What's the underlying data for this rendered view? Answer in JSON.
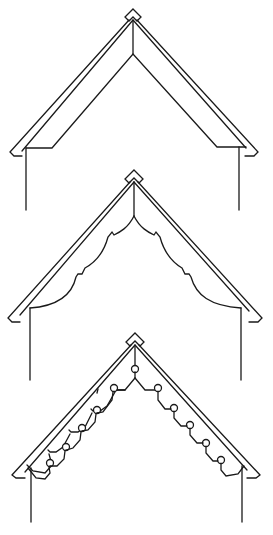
{
  "figure": {
    "description": "Three gable end designs with decorative trim",
    "line_color": "#1a1a1a",
    "background": "#ffffff",
    "gables": [
      {
        "id": "gable-plain",
        "style": "plain",
        "label": "Plain gable with straight inner brace"
      },
      {
        "id": "gable-scalloped",
        "style": "scalloped",
        "label": "Gable with scalloped curved bargeboard trim"
      },
      {
        "id": "gable-knobbed",
        "style": "knob-and-step",
        "label": "Gable with stepped trim and knob ornaments"
      }
    ],
    "knob_count_per_side": 5
  }
}
